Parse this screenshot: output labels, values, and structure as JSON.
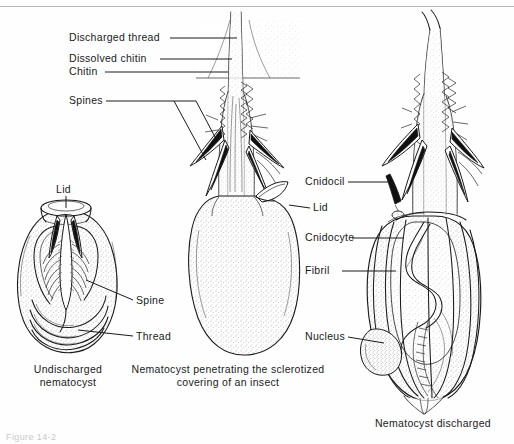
{
  "figure": {
    "domain": "biology-diagram",
    "background_color": "#fefefe",
    "ink_color": "#1a1a1a",
    "figure_number": "Figure 14-2"
  },
  "labels_left": [
    {
      "id": "discharged-thread",
      "text": "Discharged thread"
    },
    {
      "id": "dissolved-chitin",
      "text": "Dissolved chitin"
    },
    {
      "id": "chitin",
      "text": "Chitin"
    },
    {
      "id": "spines",
      "text": "Spines"
    }
  ],
  "labels_undischarged": [
    {
      "id": "lid",
      "text": "Lid"
    },
    {
      "id": "spine",
      "text": "Spine"
    },
    {
      "id": "thread",
      "text": "Thread"
    }
  ],
  "labels_middle": [
    {
      "id": "lid",
      "text": "Lid"
    }
  ],
  "labels_right": [
    {
      "id": "cnidocil",
      "text": "Cnidocil"
    },
    {
      "id": "cnidocyte",
      "text": "Cnidocyte"
    },
    {
      "id": "fibril",
      "text": "Fibril"
    },
    {
      "id": "nucleus",
      "text": "Nucleus"
    }
  ],
  "captions": [
    {
      "id": "caption-undischarged",
      "line1": "Undischarged",
      "line2": "nematocyst"
    },
    {
      "id": "caption-penetrating",
      "line1": "Nematocyst penetrating the sclerotized",
      "line2": "covering of an insect"
    },
    {
      "id": "caption-discharged",
      "line1": "Nematocyst discharged",
      "line2": ""
    }
  ],
  "panels": [
    {
      "id": "panel-undischarged",
      "name": "Undischarged nematocyst"
    },
    {
      "id": "panel-penetrating",
      "name": "Nematocyst penetrating insect cuticle"
    },
    {
      "id": "panel-discharged",
      "name": "Nematocyst discharged"
    }
  ]
}
